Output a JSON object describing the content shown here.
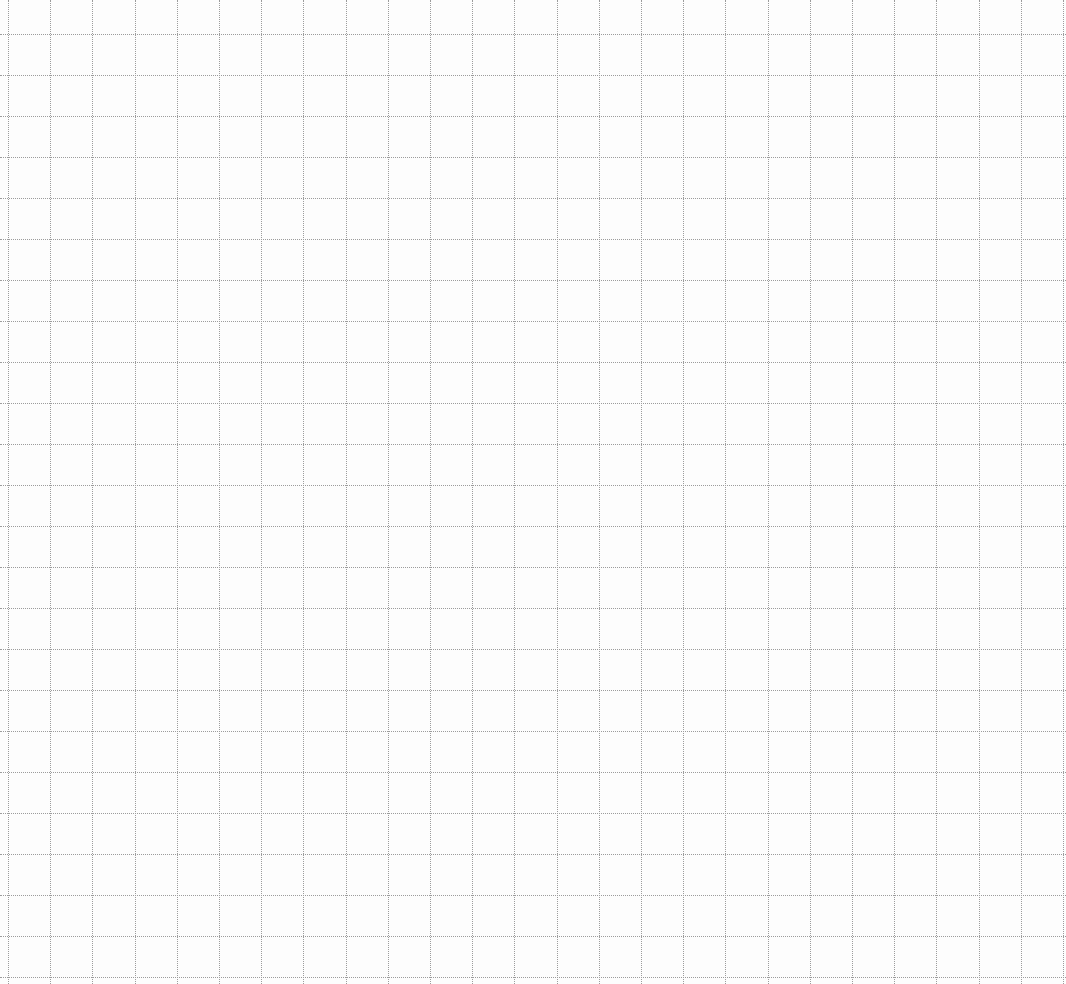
{
  "page": {
    "type": "square-ruled graph paper",
    "background_color": "#fdfdfd",
    "line_color": "#9c9c9c",
    "line_style": "dotted"
  },
  "grid": {
    "vertical_lines": {
      "count": 26,
      "first_x": 8,
      "spacing": 42.2
    },
    "horizontal_lines": {
      "count": 24,
      "first_y": 34,
      "spacing": 41.0
    }
  }
}
